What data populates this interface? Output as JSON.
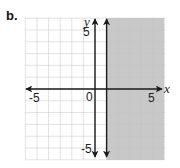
{
  "panel": {
    "label": "b."
  },
  "chart_data": {
    "type": "line",
    "title": "",
    "xlabel": "x",
    "ylabel": "y",
    "xlim": [
      -6,
      6
    ],
    "ylim": [
      -6,
      6
    ],
    "grid": true,
    "grid_step": 1,
    "tick_labels": {
      "x": [
        {
          "value": -5,
          "label": "-5"
        },
        {
          "value": 0,
          "label": "0"
        },
        {
          "value": 5,
          "label": "5"
        }
      ],
      "y": [
        {
          "value": 5,
          "label": "5"
        },
        {
          "value": -5,
          "label": "-5"
        }
      ]
    },
    "series": [
      {
        "name": "boundary",
        "kind": "vertical_line",
        "x": 1,
        "style": "solid",
        "arrows": "both"
      }
    ],
    "shaded_region": {
      "description": "right of boundary",
      "x_from": 1,
      "x_to": 6,
      "color": "#c8c8c8"
    },
    "legend": null
  },
  "colors": {
    "shade": "#c8c8c8",
    "grid": "#c4c4c4",
    "axis": "#1a1a1a",
    "background": "#ffffff"
  },
  "labels": {
    "x_axis": "x",
    "y_axis": "y",
    "origin": "0",
    "x_neg5": "-5",
    "x_pos5": "5",
    "y_pos5": "5",
    "y_neg5": "-5"
  }
}
